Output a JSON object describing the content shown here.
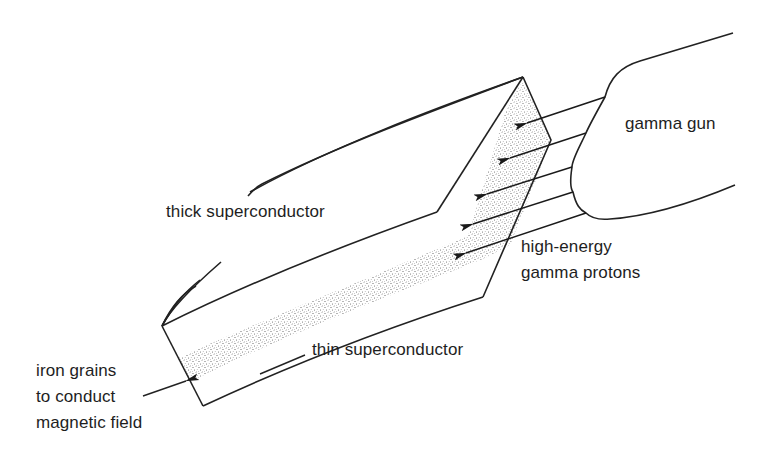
{
  "diagram": {
    "type": "schematic",
    "colors": {
      "line": "#222222",
      "stipple": "#555555",
      "background": "#ffffff"
    },
    "labels": {
      "gamma_gun": "gamma gun",
      "thick_superconductor": "thick superconductor",
      "thin_superconductor": "thin superconductor",
      "high_energy_line1": "high-energy",
      "high_energy_line2": "gamma protons",
      "iron_line1": "iron grains",
      "iron_line2": "to conduct",
      "iron_line3": "magnetic field"
    },
    "arrows": [
      {
        "from": [
          605,
          97
        ],
        "to": [
          527,
          123
        ]
      },
      {
        "from": [
          586,
          133
        ],
        "to": [
          510,
          158
        ]
      },
      {
        "from": [
          572,
          167
        ],
        "to": [
          487,
          194
        ]
      },
      {
        "from": [
          573,
          192
        ],
        "to": [
          473,
          224
        ]
      },
      {
        "from": [
          586,
          213
        ],
        "to": [
          466,
          253
        ]
      }
    ]
  }
}
